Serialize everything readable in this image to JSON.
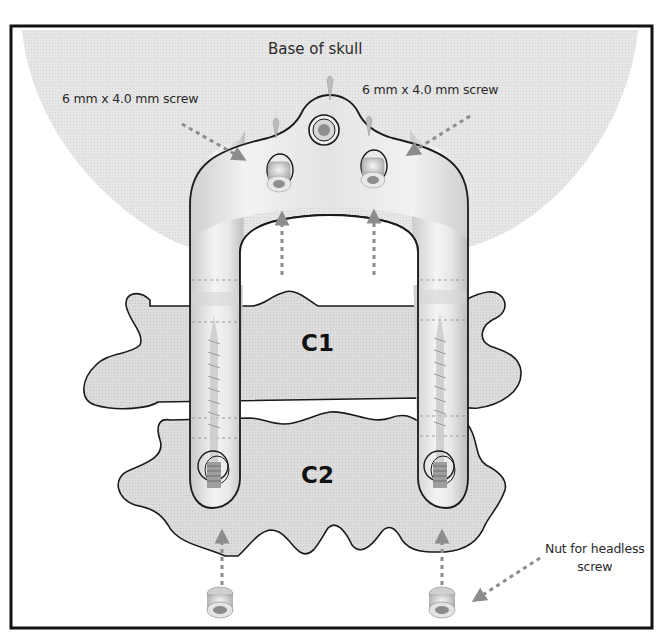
{
  "figure": {
    "labels": {
      "skull": "Base of skull",
      "screw_left": "6 mm x 4.0 mm screw",
      "screw_right": "6 mm x 4.0 mm screw",
      "nut_line1": "Nut for headless",
      "nut_line2": "screw",
      "vertebra_upper": "C1",
      "vertebra_lower": "C2"
    },
    "colors": {
      "frame": "#111111",
      "skull_fill": "#e2e2e2",
      "bone_fill": "#d6d6d6",
      "outline": "#1a1a1a",
      "implant_fill": "#ececec",
      "arrow": "#8c8c8c",
      "background": "#ffffff"
    }
  }
}
